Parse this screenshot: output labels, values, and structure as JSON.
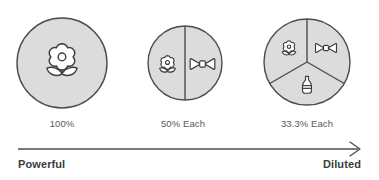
{
  "diagram": {
    "title_present": false,
    "colors": {
      "circle_fill": "#dcdcdc",
      "circle_stroke": "#4a4c4f",
      "icon_fill": "#ffffff",
      "icon_stroke": "#3b3d40",
      "axis": "#4a4c4f",
      "label_text": "#57595c",
      "end_text": "#3b3d40",
      "background": "#ffffff"
    },
    "circles": [
      {
        "id": "circle-one-ingredient",
        "segments": 1,
        "percent_label": "100%",
        "icons": [
          "flower-icon"
        ]
      },
      {
        "id": "circle-two-ingredients",
        "segments": 2,
        "percent_label": "50% Each",
        "icons": [
          "flower-icon",
          "bowtie-icon"
        ]
      },
      {
        "id": "circle-three-ingredients",
        "segments": 3,
        "percent_label": "33.3% Each",
        "icons": [
          "flower-icon",
          "bowtie-icon",
          "bottle-icon"
        ]
      }
    ],
    "axis": {
      "direction": "left-to-right",
      "arrowhead": "right",
      "left_label": "Powerful",
      "right_label": "Diluted"
    }
  }
}
